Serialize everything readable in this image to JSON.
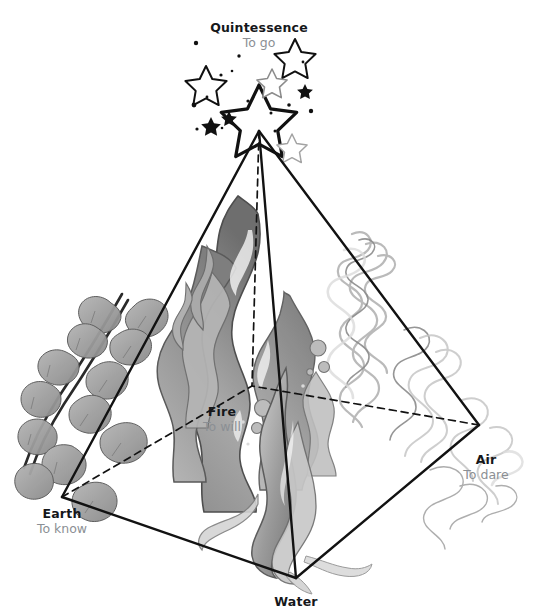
{
  "diagram": {
    "title_role": "classical-elements-tetrahedron",
    "background_color": "#ffffff",
    "line_color": "#121212",
    "label_color": "#15171a",
    "motto_color": "#8b8f94",
    "art_color_dark": "#6f6f6f",
    "art_color_light": "#c9c9c9"
  },
  "vertices": [
    {
      "id": "quintessence",
      "name": "Quintessence",
      "motto": "To go",
      "icon": "star-cluster-icon",
      "x": 259,
      "y": 131,
      "hidden": false
    },
    {
      "id": "fire",
      "name": "Fire",
      "motto": "To will",
      "icon": "flame-icon",
      "x": 252,
      "y": 386,
      "hidden": true
    },
    {
      "id": "earth",
      "name": "Earth",
      "motto": "To know",
      "icon": "ivy-leaf-icon",
      "x": 62,
      "y": 497,
      "hidden": false
    },
    {
      "id": "air",
      "name": "Air",
      "motto": "To dare",
      "icon": "smoke-swirl-icon",
      "x": 479,
      "y": 425,
      "hidden": false
    },
    {
      "id": "water",
      "name": "Water",
      "motto": "",
      "icon": "wave-icon",
      "x": 296,
      "y": 578,
      "hidden": false
    }
  ],
  "edges": [
    {
      "from": "quintessence",
      "to": "earth",
      "style": "solid"
    },
    {
      "from": "quintessence",
      "to": "air",
      "style": "solid"
    },
    {
      "from": "quintessence",
      "to": "water",
      "style": "solid"
    },
    {
      "from": "earth",
      "to": "water",
      "style": "solid"
    },
    {
      "from": "water",
      "to": "air",
      "style": "solid"
    },
    {
      "from": "quintessence",
      "to": "fire",
      "style": "dashed"
    },
    {
      "from": "earth",
      "to": "fire",
      "style": "dashed"
    },
    {
      "from": "air",
      "to": "fire",
      "style": "dashed"
    }
  ]
}
